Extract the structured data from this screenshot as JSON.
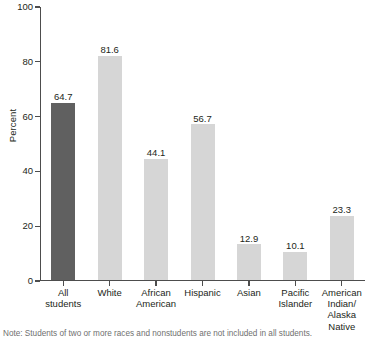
{
  "chart_data": {
    "type": "bar",
    "title": "",
    "subtitle": "",
    "xlabel": "",
    "ylabel": "Percent",
    "ylim": [
      0,
      100
    ],
    "ytick_values": [
      0,
      20,
      40,
      60,
      80,
      100
    ],
    "ytick_labels": [
      "0",
      "20",
      "40",
      "60",
      "80",
      "100"
    ],
    "grid": false,
    "legend": "none",
    "categories": [
      "All\nstudents",
      "White",
      "African\nAmerican",
      "Hispanic",
      "Asian",
      "Pacific\nIslander",
      "American\nIndian/\nAlaska\nNative"
    ],
    "values": [
      64.7,
      81.6,
      44.1,
      56.7,
      12.9,
      10.1,
      23.3
    ],
    "value_labels": [
      "64.7",
      "81.6",
      "44.1",
      "56.7",
      "12.9",
      "10.1",
      "23.3"
    ],
    "bar_colors": [
      "#606060",
      "#d6d6d6",
      "#d6d6d6",
      "#d6d6d6",
      "#d6d6d6",
      "#d6d6d6",
      "#d6d6d6"
    ],
    "axis_color": "#4d4d4d",
    "text_color": "#231f20"
  },
  "footnote": {
    "text": "Note: Students of two or more races and nonstudents are not included in all students."
  }
}
